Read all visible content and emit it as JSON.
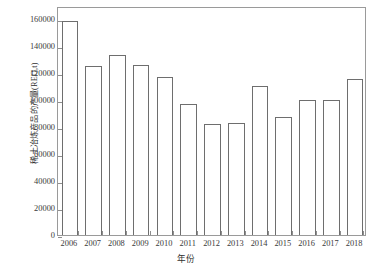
{
  "chart_data": {
    "type": "bar",
    "title": "",
    "xlabel": "年份",
    "ylabel": "稀土冶炼产品的产量(REO,t)",
    "categories": [
      "2006",
      "2007",
      "2008",
      "2009",
      "2010",
      "2011",
      "2012",
      "2013",
      "2014",
      "2015",
      "2016",
      "2017",
      "2018"
    ],
    "values": [
      159000,
      125500,
      133700,
      126200,
      117200,
      97000,
      82100,
      82800,
      110500,
      87300,
      100000,
      100000,
      115700
    ],
    "ylim": [
      0,
      170000
    ],
    "yticks": [
      0,
      20000,
      40000,
      60000,
      80000,
      100000,
      120000,
      140000,
      160000
    ],
    "ytick_labels": [
      "0",
      "20000",
      "40000",
      "60000",
      "80000",
      "100000",
      "120000",
      "140000",
      "160000"
    ],
    "grid": false,
    "legend": "none",
    "bar_fill": "#ffffff",
    "bar_edge": "#6e6e6e",
    "frame_color": "#9a9a9a",
    "text_color": "#3a3a3a"
  }
}
